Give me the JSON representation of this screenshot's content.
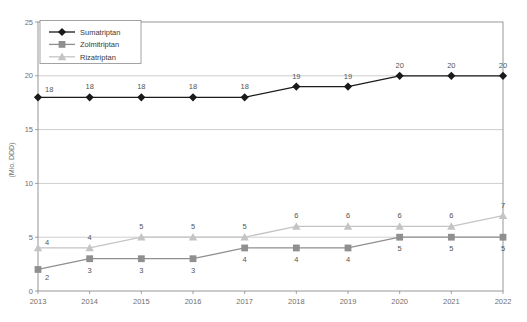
{
  "chart_data": {
    "type": "line",
    "title": "",
    "xlabel": "",
    "ylabel": "(Mio. DDD)",
    "categories": [
      "2013",
      "2014",
      "2015",
      "2016",
      "2017",
      "2018",
      "2019",
      "2020",
      "2021",
      "2022"
    ],
    "ylim": [
      0,
      25
    ],
    "yticks": [
      "0",
      "5",
      "10",
      "15",
      "20",
      "25"
    ],
    "grid": "horizontal",
    "legend_position": "top-left",
    "series": [
      {
        "name": "Sumatriptan",
        "marker": "diamond",
        "color": "#1a1a1a",
        "values": [
          18,
          18,
          18,
          18,
          18,
          19,
          19,
          20,
          20,
          20
        ],
        "labels": [
          "18",
          "18",
          "18",
          "18",
          "18",
          "19",
          "19",
          "20",
          "20",
          "20"
        ]
      },
      {
        "name": "Zolmitriptan",
        "marker": "square",
        "color": "#8f8f8f",
        "values": [
          2,
          3,
          3,
          3,
          4,
          4,
          4,
          5,
          5,
          5
        ],
        "labels": [
          "2",
          "3",
          "3",
          "3",
          "4",
          "4",
          "4",
          "5",
          "5",
          "5"
        ]
      },
      {
        "name": "Rizatriptan",
        "marker": "triangle",
        "color": "#c4c4c4",
        "values": [
          4,
          4,
          5,
          5,
          5,
          6,
          6,
          6,
          6,
          7
        ],
        "labels": [
          "4",
          "4",
          "5",
          "5",
          "5",
          "6",
          "6",
          "6",
          "6",
          "7"
        ]
      }
    ]
  },
  "yaxis": {
    "ticks": [
      "0",
      "5",
      "10",
      "15",
      "20",
      "25"
    ],
    "title": "(Mio. DDD)"
  },
  "xaxis": {
    "ticks": [
      "2013",
      "2014",
      "2015",
      "2016",
      "2017",
      "2018",
      "2019",
      "2020",
      "2021",
      "2022"
    ]
  },
  "legend": {
    "items": [
      {
        "label": "Sumatriptan"
      },
      {
        "label": "Zolmitriptan"
      },
      {
        "label": "Rizatriptan"
      }
    ]
  }
}
